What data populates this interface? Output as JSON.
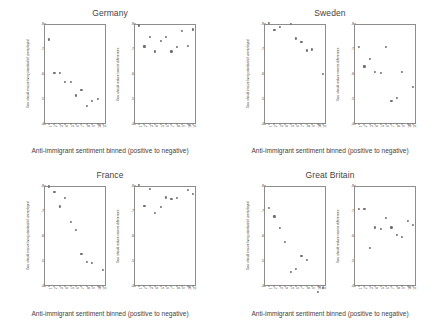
{
  "figure": {
    "xlabel_caption": "Anti-immigrant sentiment binned (positive to negative)",
    "ylabel_unemployed": "Gov. should ensure living standard of unemployed",
    "ylabel_income": "Gov. should reduce income differences",
    "point_color": "#6f6f6f",
    "axis_color": "#8d8d8d"
  },
  "chart_data": [
    {
      "type": "scatter",
      "title": "Germany",
      "panel": "left",
      "xlabel": "Anti-immigrant sentiment binned (positive to negative)",
      "ylabel": "Gov. should ensure living standard of unemployed",
      "ylim": [
        0.4,
        0.8
      ],
      "yticks": [
        0.4,
        0.5,
        0.6,
        0.7,
        0.8
      ],
      "ytick_labels": [
        ".4",
        ".5",
        ".6",
        ".7",
        ".8"
      ],
      "x": [
        1,
        2,
        3,
        4,
        5,
        6,
        7,
        8,
        9,
        10,
        11
      ],
      "xtick_labels": [
        "1",
        "2",
        "3",
        "4",
        "5",
        "6",
        "7",
        "8",
        "9",
        "10",
        "11"
      ],
      "values": [
        0.732,
        0.597,
        0.597,
        0.563,
        0.562,
        0.508,
        0.531,
        0.466,
        0.487,
        0.493,
        null
      ],
      "grid": false,
      "legend": "none"
    },
    {
      "type": "scatter",
      "title": "Germany",
      "panel": "right",
      "xlabel": "Anti-immigrant sentiment binned (positive to negative)",
      "ylabel": "Gov. should reduce income differences",
      "ylim": [
        0.4,
        0.8
      ],
      "yticks": [
        0.4,
        0.5,
        0.6,
        0.7,
        0.8
      ],
      "ytick_labels": [
        ".4",
        ".5",
        ".6",
        ".7",
        ".8"
      ],
      "x": [
        1,
        2,
        3,
        4,
        5,
        6,
        7,
        8,
        9,
        10,
        11
      ],
      "xtick_labels": [
        "1",
        "2",
        "3",
        "4",
        "5",
        "6",
        "7",
        "8",
        "9",
        "10",
        "11"
      ],
      "values": [
        0.788,
        0.704,
        0.741,
        0.684,
        0.726,
        0.742,
        0.684,
        0.703,
        0.766,
        0.707,
        0.772
      ],
      "grid": false,
      "legend": "none"
    },
    {
      "type": "scatter",
      "title": "Sweden",
      "panel": "left",
      "xlabel": "Anti-immigrant sentiment binned (positive to negative)",
      "ylabel": "Gov. should ensure living standard of unemployed",
      "ylim": [
        0.4,
        0.8
      ],
      "yticks": [
        0.4,
        0.5,
        0.6,
        0.7,
        0.8
      ],
      "ytick_labels": [
        ".4",
        ".5",
        ".6",
        ".7",
        ".8"
      ],
      "x": [
        1,
        2,
        3,
        4,
        5,
        6,
        7,
        8,
        9,
        10,
        11
      ],
      "xtick_labels": [
        "1",
        "2",
        "3",
        "4",
        "5",
        "6",
        "7",
        "8",
        "9",
        "10",
        "11"
      ],
      "values": [
        0.797,
        0.771,
        0.781,
        null,
        0.793,
        0.736,
        0.722,
        0.688,
        0.692,
        null,
        0.594
      ],
      "grid": false,
      "legend": "none"
    },
    {
      "type": "scatter",
      "title": "Sweden",
      "panel": "right",
      "xlabel": "Anti-immigrant sentiment binned (positive to negative)",
      "ylabel": "Gov. should reduce income differences",
      "ylim": [
        0.4,
        0.8
      ],
      "yticks": [
        0.4,
        0.5,
        0.6,
        0.7,
        0.8
      ],
      "ytick_labels": [
        ".4",
        ".5",
        ".6",
        ".7",
        ".8"
      ],
      "x": [
        1,
        2,
        3,
        4,
        5,
        6,
        7,
        8,
        9,
        10,
        11
      ],
      "xtick_labels": [
        "1",
        "2",
        "3",
        "4",
        "5",
        "6",
        "7",
        "8",
        "9",
        "10",
        "11"
      ],
      "values": [
        0.702,
        0.624,
        0.654,
        0.603,
        0.598,
        0.702,
        0.487,
        0.497,
        0.601,
        null,
        0.542
      ],
      "grid": false,
      "legend": "none"
    },
    {
      "type": "scatter",
      "title": "France",
      "panel": "left",
      "xlabel": "Anti-immigrant sentiment binned (positive to negative)",
      "ylabel": "Gov. should ensure living standard of unemployed",
      "ylim": [
        0.4,
        0.8
      ],
      "yticks": [
        0.4,
        0.5,
        0.6,
        0.7,
        0.8
      ],
      "ytick_labels": [
        ".4",
        ".5",
        ".6",
        ".7",
        ".8"
      ],
      "x": [
        1,
        2,
        3,
        4,
        5,
        6,
        7,
        8,
        9,
        10,
        11
      ],
      "xtick_labels": [
        "1",
        "2",
        "3",
        "4",
        "5",
        "6",
        "7",
        "8",
        "9",
        "10",
        "11"
      ],
      "values": [
        0.792,
        0.771,
        0.712,
        0.745,
        0.651,
        0.617,
        0.523,
        0.489,
        0.487,
        null,
        0.457
      ],
      "grid": false,
      "legend": "none"
    },
    {
      "type": "scatter",
      "title": "France",
      "panel": "right",
      "xlabel": "Anti-immigrant sentiment binned (positive to negative)",
      "ylabel": "Gov. should reduce income differences",
      "ylim": [
        0.4,
        0.8
      ],
      "yticks": [
        0.4,
        0.5,
        0.6,
        0.7,
        0.8
      ],
      "ytick_labels": [
        ".4",
        ".5",
        ".6",
        ".7",
        ".8"
      ],
      "x": [
        1,
        2,
        3,
        4,
        5,
        6,
        7,
        8,
        9,
        10,
        11
      ],
      "xtick_labels": [
        "1",
        "2",
        "3",
        "4",
        "5",
        "6",
        "7",
        "8",
        "9",
        "10",
        "11"
      ],
      "values": [
        0.798,
        0.713,
        0.781,
        0.686,
        0.709,
        0.748,
        0.742,
        0.745,
        null,
        0.779,
        0.762
      ],
      "grid": false,
      "legend": "none"
    },
    {
      "type": "scatter",
      "title": "Great Britain",
      "panel": "left",
      "xlabel": "Anti-immigrant sentiment binned (positive to negative)",
      "ylabel": "Gov. should ensure living standard of unemployed",
      "ylim": [
        0.4,
        0.8
      ],
      "yticks": [
        0.4,
        0.5,
        0.6,
        0.7,
        0.8
      ],
      "ytick_labels": [
        ".4",
        ".5",
        ".6",
        ".7",
        ".8"
      ],
      "x": [
        1,
        2,
        3,
        4,
        5,
        6,
        7,
        8,
        9,
        10,
        11
      ],
      "xtick_labels": [
        "1",
        "2",
        "3",
        "4",
        "5",
        "6",
        "7",
        "8",
        "9",
        "10",
        "11"
      ],
      "values": [
        0.706,
        0.672,
        0.625,
        0.571,
        0.451,
        0.461,
        0.513,
        0.498,
        null,
        0.369,
        0.386
      ],
      "grid": false,
      "legend": "none"
    },
    {
      "type": "scatter",
      "title": "Great Britain",
      "panel": "right",
      "xlabel": "Anti-immigrant sentiment binned (positive to negative)",
      "ylabel": "Gov. should reduce income differences",
      "ylim": [
        0.4,
        0.8
      ],
      "yticks": [
        0.4,
        0.5,
        0.6,
        0.7,
        0.8
      ],
      "ytick_labels": [
        ".4",
        ".5",
        ".6",
        ".7",
        ".8"
      ],
      "x": [
        1,
        2,
        3,
        4,
        5,
        6,
        7,
        8,
        9,
        10,
        11
      ],
      "xtick_labels": [
        "1",
        "2",
        "3",
        "4",
        "5",
        "6",
        "7",
        "8",
        "9",
        "10",
        "11"
      ],
      "values": [
        0.701,
        0.702,
        0.545,
        0.628,
        0.622,
        0.666,
        0.628,
        0.597,
        0.591,
        0.653,
        0.638
      ],
      "grid": false,
      "legend": "none"
    }
  ],
  "panels": [
    {
      "id": "germany",
      "title": "Germany",
      "left_index": 0,
      "right_index": 1
    },
    {
      "id": "sweden",
      "title": "Sweden",
      "left_index": 2,
      "right_index": 3
    },
    {
      "id": "france",
      "title": "France",
      "left_index": 4,
      "right_index": 5
    },
    {
      "id": "great-britain",
      "title": "Great Britain",
      "left_index": 6,
      "right_index": 7
    }
  ]
}
